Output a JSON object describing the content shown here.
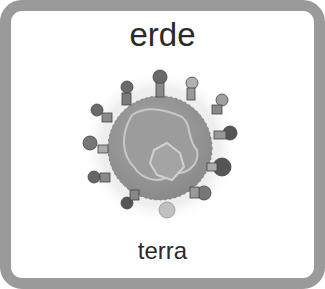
{
  "card": {
    "title_word": "erde",
    "translation_word": "terra",
    "border_color": "#9a9a9a",
    "illustration": {
      "icon": "earth-with-children-icon",
      "description": "grayscale globe surrounded by children holding hands"
    }
  }
}
